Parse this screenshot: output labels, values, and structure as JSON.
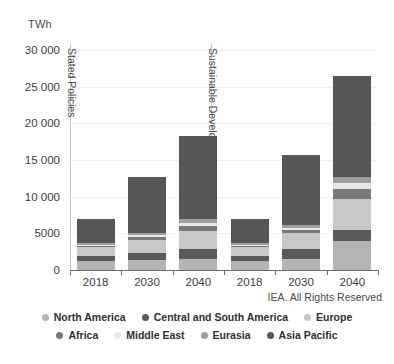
{
  "chart_data": {
    "type": "bar",
    "title": "",
    "subtitle": "",
    "unit_label": "TWh",
    "xlabel": "",
    "ylabel": "TWh",
    "ylim": [
      0,
      30000
    ],
    "ytick_labels": [
      "0",
      "5000",
      "10 000",
      "15 000",
      "20 000",
      "25 000",
      "30 000"
    ],
    "ytick_values": [
      0,
      5000,
      10000,
      15000,
      20000,
      25000,
      30000
    ],
    "grid": false,
    "stacked": true,
    "legend_position": "bottom",
    "categories": [
      "2018",
      "2030",
      "2040",
      "2018",
      "2030",
      "2040"
    ],
    "scenarios": [
      {
        "name": "Stated Policies",
        "categories": [
          "2018",
          "2030",
          "2040"
        ]
      },
      {
        "name": "Sustainable Development",
        "categories": [
          "2018",
          "2030",
          "2040"
        ]
      }
    ],
    "series": [
      {
        "name": "North America",
        "color": "#b4b4b4",
        "values": [
          1200,
          1300,
          1500,
          1200,
          1500,
          3900
        ]
      },
      {
        "name": "Central and South America",
        "color": "#5a5a5a",
        "values": [
          700,
          1000,
          1300,
          700,
          1300,
          1500
        ]
      },
      {
        "name": "Europe",
        "color": "#c8c8c8",
        "values": [
          1200,
          1800,
          2500,
          1200,
          2200,
          4300
        ]
      },
      {
        "name": "Africa",
        "color": "#787878",
        "values": [
          200,
          400,
          700,
          200,
          500,
          1300
        ]
      },
      {
        "name": "Middle East",
        "color": "#e8e8e8",
        "values": [
          150,
          250,
          400,
          150,
          300,
          800
        ]
      },
      {
        "name": "Eurasia",
        "color": "#9e9e9e",
        "values": [
          250,
          350,
          500,
          250,
          400,
          900
        ]
      },
      {
        "name": "Asia Pacific",
        "color": "#565656",
        "values": [
          3300,
          7600,
          11400,
          3300,
          9500,
          13800
        ]
      }
    ],
    "totals": [
      7000,
      12700,
      18300,
      7000,
      15700,
      26500
    ],
    "annotations": [
      "IEA. All Rights Reserved"
    ],
    "credit": "IEA. All Rights Reserved"
  },
  "legend": {
    "row1": [
      {
        "label": "North America",
        "color": "#b4b4b4"
      },
      {
        "label": "Central and South America",
        "color": "#5a5a5a"
      },
      {
        "label": "Europe",
        "color": "#c8c8c8"
      }
    ],
    "row2": [
      {
        "label": "Africa",
        "color": "#787878"
      },
      {
        "label": "Middle East",
        "color": "#e8e8e8"
      },
      {
        "label": "Eurasia",
        "color": "#9e9e9e"
      },
      {
        "label": "Asia Pacific",
        "color": "#565656"
      }
    ]
  },
  "colors": {
    "axis": "#6b6b6b",
    "guide": "#c9c9c9",
    "text": "#3c3c3c",
    "background": "#ffffff"
  }
}
